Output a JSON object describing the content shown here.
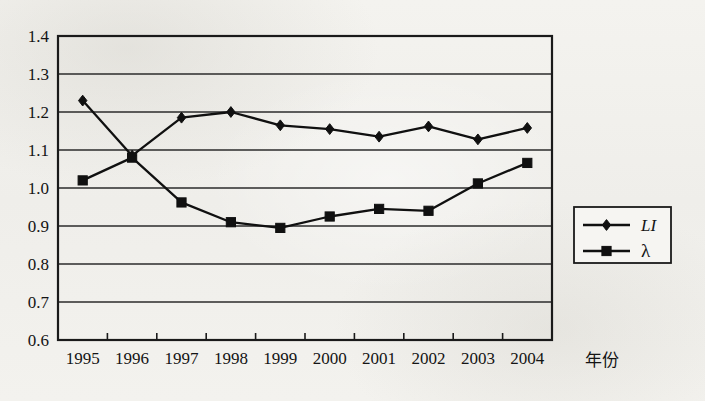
{
  "chart_data": {
    "type": "line",
    "title": "",
    "xlabel": "年份",
    "ylabel": "",
    "categories": [
      "1995",
      "1996",
      "1997",
      "1998",
      "1999",
      "2000",
      "2001",
      "2002",
      "2003",
      "2004"
    ],
    "ylim": [
      0.6,
      1.4
    ],
    "ytick_step": 0.1,
    "yticks": [
      "1.4",
      "1.3",
      "1.2",
      "1.1",
      "1.0",
      "0.9",
      "0.8",
      "0.7",
      "0.6"
    ],
    "ytick_values": [
      1.4,
      1.3,
      1.2,
      1.1,
      1.0,
      0.9,
      0.8,
      0.7,
      0.6
    ],
    "grid": true,
    "legend_position": "right",
    "series": [
      {
        "name": "LI",
        "marker": "diamond",
        "color": "#101010",
        "values": [
          1.23,
          1.085,
          1.185,
          1.2,
          1.165,
          1.155,
          1.135,
          1.162,
          1.128,
          1.158
        ]
      },
      {
        "name": "λ",
        "marker": "square",
        "color": "#101010",
        "values": [
          1.02,
          1.08,
          0.962,
          0.91,
          0.895,
          0.925,
          0.945,
          0.94,
          1.012,
          1.066
        ]
      }
    ]
  },
  "legend": {
    "items": [
      {
        "label": "LI",
        "marker": "diamond"
      },
      {
        "label": "λ",
        "marker": "square"
      }
    ]
  },
  "axis": {
    "x_title": "年份"
  },
  "colors": {
    "line": "#101010",
    "grid": "#2b2b2b",
    "frame": "#1a1a1a",
    "background": "#f2f1ed",
    "text": "#141414"
  }
}
